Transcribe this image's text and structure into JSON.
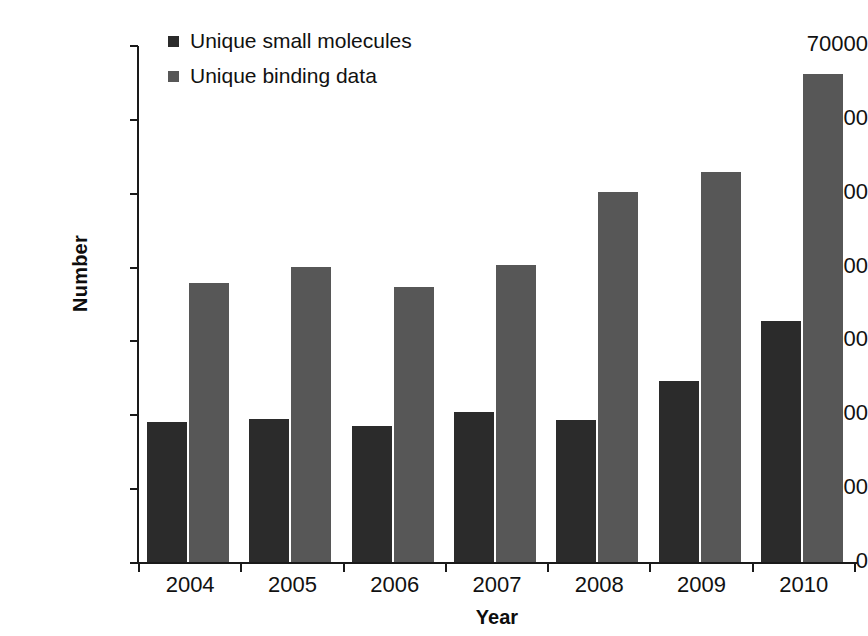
{
  "chart_data": {
    "type": "bar",
    "title": "",
    "xlabel": "Year",
    "ylabel": "Number",
    "categories": [
      "2004",
      "2005",
      "2006",
      "2007",
      "2008",
      "2009",
      "2010"
    ],
    "series": [
      {
        "name": "Unique small molecules",
        "color": "#2b2b2b",
        "values": [
          19100,
          19500,
          18600,
          20400,
          19400,
          24700,
          32800
        ]
      },
      {
        "name": "Unique binding data",
        "color": "#575757",
        "values": [
          37900,
          40100,
          37400,
          40300,
          50200,
          52900,
          66200
        ]
      }
    ],
    "ylim": [
      0,
      70000
    ],
    "ytick_values": [
      0,
      10000,
      20000,
      30000,
      40000,
      50000,
      60000,
      70000
    ],
    "ytick_labels": [
      "0",
      "10000",
      "20000",
      "30000",
      "40000",
      "50000",
      "60000",
      "70000"
    ],
    "grid": false,
    "legend_position": "top-left"
  }
}
